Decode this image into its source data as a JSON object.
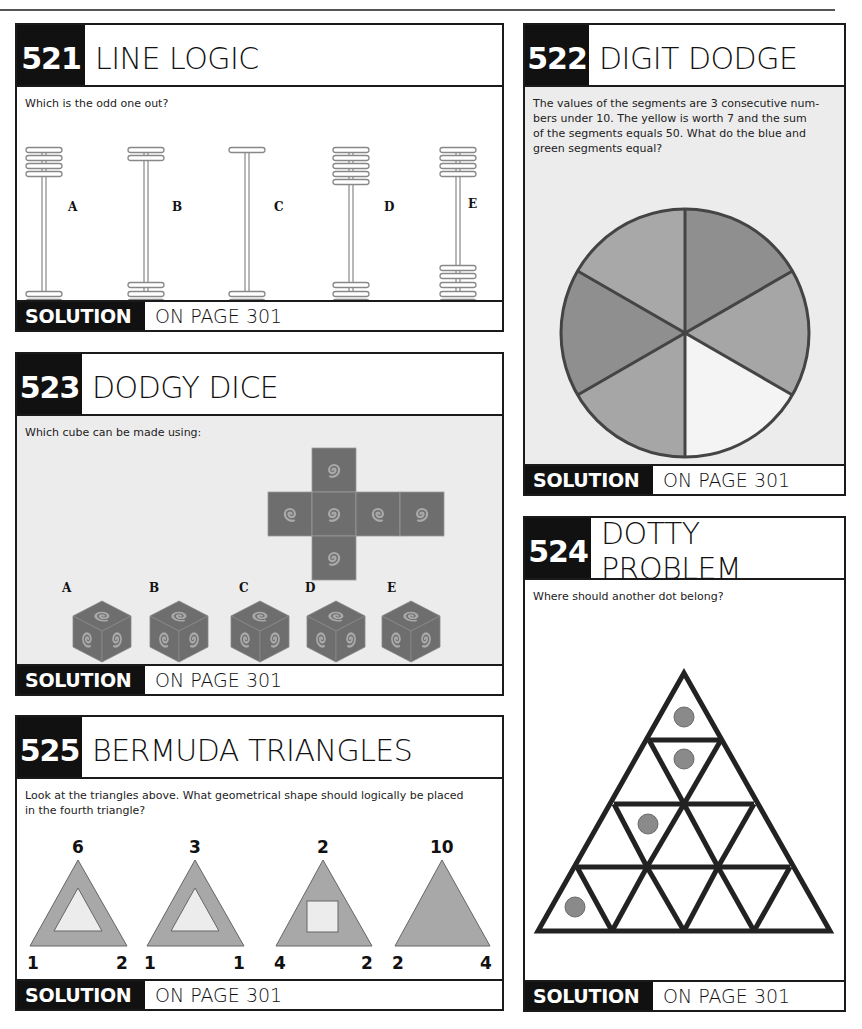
{
  "page": {
    "colors": {
      "ink": "#111111",
      "panel_gray": "#ececec",
      "shape_gray": "#a8a8a8",
      "shape_dark": "#8f8f8f",
      "cube_face": "#6e6e6e",
      "spiral": "#a9a9a9",
      "dot": "#8a8a8a"
    }
  },
  "puzzles": {
    "p521": {
      "number": "521",
      "title": "LINE LOGIC",
      "question": "Which is the odd one out?",
      "figures": [
        {
          "label": "A",
          "top_bars": 4,
          "bottom_bars": 2
        },
        {
          "label": "B",
          "top_bars": 2,
          "bottom_bars": 3
        },
        {
          "label": "C",
          "top_bars": 1,
          "bottom_bars": 2
        },
        {
          "label": "D",
          "top_bars": 5,
          "bottom_bars": 3
        },
        {
          "label": "E",
          "top_bars": 4,
          "bottom_bars": 6
        }
      ],
      "solution_label": "SOLUTION",
      "solution_page": "ON PAGE 301"
    },
    "p522": {
      "number": "522",
      "title": "DIGIT DODGE",
      "question_lines": [
        "The values of the segments are 3 consecutive num-",
        "bers under 10. The yellow is worth 7 and the sum",
        "of the segments equals 50. What do the blue and",
        "green segments equal?"
      ],
      "segments": [
        {
          "position": "top-right",
          "shade": "dark"
        },
        {
          "position": "right",
          "shade": "light"
        },
        {
          "position": "bottom-right",
          "shade": "white"
        },
        {
          "position": "bottom-left",
          "shade": "light"
        },
        {
          "position": "left",
          "shade": "dark"
        },
        {
          "position": "top-left",
          "shade": "light"
        }
      ],
      "solution_label": "SOLUTION",
      "solution_page": "ON PAGE 301"
    },
    "p523": {
      "number": "523",
      "title": "DODGY DICE",
      "question": "Which cube can be made using:",
      "cube_labels": [
        "A",
        "B",
        "C",
        "D",
        "E"
      ],
      "solution_label": "SOLUTION",
      "solution_page": "ON PAGE 301"
    },
    "p524": {
      "number": "524",
      "title": "DOTTY PROBLEM",
      "question": "Where should another dot belong?",
      "dot_count": 4,
      "solution_label": "SOLUTION",
      "solution_page": "ON PAGE 301"
    },
    "p525": {
      "number": "525",
      "title": "BERMUDA TRIANGLES",
      "question_lines": [
        "Look at the triangles above. What geometrical shape should logically be placed",
        "in the fourth triangle?"
      ],
      "triangles": [
        {
          "top": "6",
          "left": "1",
          "right": "2",
          "inner": "triangle"
        },
        {
          "top": "3",
          "left": "1",
          "right": "1",
          "inner": "triangle"
        },
        {
          "top": "2",
          "left": "4",
          "right": "2",
          "inner": "square"
        },
        {
          "top": "10",
          "left": "2",
          "right": "4",
          "inner": "none"
        }
      ],
      "solution_label": "SOLUTION",
      "solution_page": "ON PAGE 301"
    }
  }
}
